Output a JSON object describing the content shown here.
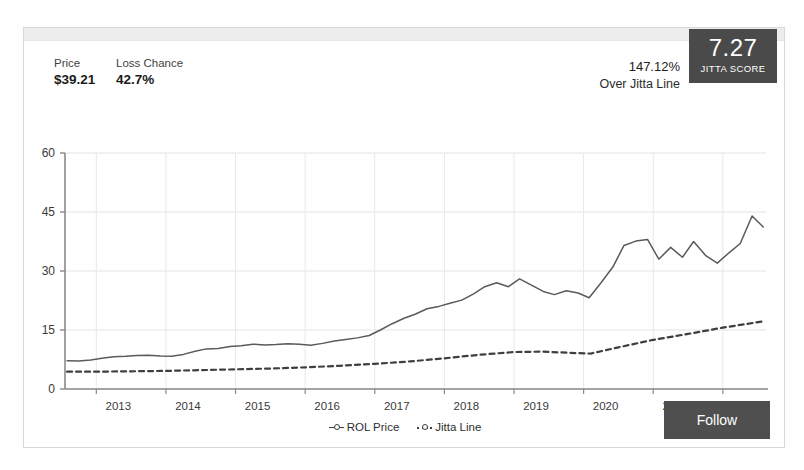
{
  "card": {
    "stats": [
      {
        "label": "Price",
        "value": "$39.21"
      },
      {
        "label": "Loss Chance",
        "value": "42.7%"
      }
    ],
    "over_jitta": {
      "percent": "147.12%",
      "caption": "Over Jitta Line"
    },
    "jitta_score": {
      "value": "7.27",
      "caption": "JITTA SCORE"
    },
    "follow_button": "Follow"
  },
  "chart_data": {
    "type": "line",
    "title": "",
    "xlabel": "",
    "ylabel": "",
    "ylim": [
      0,
      60
    ],
    "yticks": [
      0,
      15,
      30,
      45,
      60
    ],
    "xticks": [
      "2013",
      "2014",
      "2015",
      "2016",
      "2017",
      "2018",
      "2019",
      "2020",
      "2021",
      "2022"
    ],
    "grid": true,
    "legend_position": "bottom",
    "xlim": [
      2012.55,
      2022.62
    ],
    "series": [
      {
        "name": "ROL Price",
        "style": "solid",
        "color": "#5a5a5a",
        "x": [
          2012.58,
          2012.75,
          2012.92,
          2013.08,
          2013.25,
          2013.42,
          2013.58,
          2013.75,
          2013.92,
          2014.08,
          2014.25,
          2014.42,
          2014.58,
          2014.75,
          2014.92,
          2015.08,
          2015.25,
          2015.42,
          2015.58,
          2015.75,
          2015.92,
          2016.08,
          2016.25,
          2016.42,
          2016.58,
          2016.75,
          2016.92,
          2017.08,
          2017.25,
          2017.42,
          2017.58,
          2017.75,
          2017.92,
          2018.08,
          2018.25,
          2018.42,
          2018.58,
          2018.75,
          2018.92,
          2019.08,
          2019.25,
          2019.42,
          2019.58,
          2019.75,
          2019.92,
          2020.08,
          2020.25,
          2020.42,
          2020.58,
          2020.75,
          2020.92,
          2021.08,
          2021.25,
          2021.42,
          2021.58,
          2021.75,
          2021.92,
          2022.08,
          2022.25,
          2022.42,
          2022.58
        ],
        "y": [
          7.2,
          7.1,
          7.4,
          7.8,
          8.2,
          8.3,
          8.5,
          8.6,
          8.4,
          8.3,
          8.8,
          9.6,
          10.2,
          10.3,
          10.8,
          11.0,
          11.4,
          11.2,
          11.3,
          11.5,
          11.4,
          11.1,
          11.6,
          12.2,
          12.6,
          13.0,
          13.6,
          15.0,
          16.6,
          18.0,
          19.0,
          20.4,
          21.0,
          21.8,
          22.6,
          24.2,
          26.0,
          27.0,
          26.0,
          28.0,
          26.4,
          24.8,
          24.0,
          25.0,
          24.4,
          23.2,
          27.0,
          31.0,
          36.5,
          37.6,
          38.0,
          33.0,
          36.0,
          33.5,
          37.5,
          34.0,
          32.0,
          34.5,
          37.0,
          44.0,
          41.2
        ]
      },
      {
        "name": "Jitta Line",
        "style": "dashed",
        "color": "#3f3f3f",
        "x": [
          2012.58,
          2013.0,
          2013.5,
          2014.0,
          2014.5,
          2015.0,
          2015.5,
          2016.0,
          2016.5,
          2017.0,
          2017.5,
          2018.0,
          2018.5,
          2019.0,
          2019.4,
          2019.8,
          2020.1,
          2020.5,
          2021.0,
          2021.5,
          2022.0,
          2022.58
        ],
        "y": [
          4.4,
          4.4,
          4.5,
          4.6,
          4.8,
          5.0,
          5.2,
          5.5,
          5.9,
          6.4,
          7.0,
          7.8,
          8.7,
          9.4,
          9.5,
          9.2,
          9.0,
          10.6,
          12.5,
          14.0,
          15.6,
          17.2
        ]
      }
    ]
  }
}
